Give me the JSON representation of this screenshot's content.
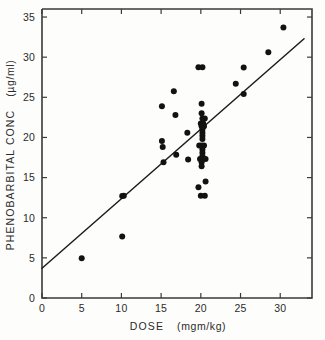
{
  "chart_data": {
    "type": "scatter",
    "title": "",
    "xlabel": "DOSE  (mgm/kg)",
    "xlabel_main": "DOSE",
    "xlabel_unit": "(mgm/kg)",
    "ylabel": "PHENOBARBITAL  CONC  (µg/ml)",
    "ylabel_main": "PHENOBARBITAL  CONC",
    "ylabel_unit": "(µg/ml)",
    "xlim": [
      0,
      34
    ],
    "ylim": [
      0,
      36
    ],
    "xticks": [
      0,
      5,
      10,
      15,
      20,
      25,
      30
    ],
    "yticks": [
      0,
      5,
      10,
      15,
      20,
      25,
      30,
      35
    ],
    "xtick_labels": [
      "0",
      "5",
      "10",
      "15",
      "20",
      "25",
      "30"
    ],
    "ytick_labels": [
      "0",
      "5",
      "10",
      "15",
      "20",
      "25",
      "30",
      "35"
    ],
    "grid": false,
    "legend": null,
    "marker": "filled-circle",
    "marker_color": "#121210",
    "point_radius_px": 3.0,
    "fit_line": {
      "label": "linear regression",
      "color": "#1d1d1b",
      "x": [
        0.0,
        33.0
      ],
      "y": [
        3.7,
        32.3
      ],
      "intercept": 3.7,
      "slope": 0.867
    },
    "points": [
      [
        5.0,
        4.95
      ],
      [
        10.1,
        7.65
      ],
      [
        10.1,
        12.7
      ],
      [
        10.3,
        12.75
      ],
      [
        15.1,
        23.9
      ],
      [
        15.1,
        19.55
      ],
      [
        15.2,
        18.8
      ],
      [
        15.3,
        16.9
      ],
      [
        16.6,
        25.75
      ],
      [
        16.8,
        22.8
      ],
      [
        16.9,
        17.85
      ],
      [
        18.3,
        20.6
      ],
      [
        18.4,
        17.25
      ],
      [
        19.7,
        28.75
      ],
      [
        20.2,
        28.75
      ],
      [
        20.1,
        24.2
      ],
      [
        20.1,
        23.0
      ],
      [
        20.2,
        22.35
      ],
      [
        20.5,
        22.35
      ],
      [
        20.0,
        21.75
      ],
      [
        20.3,
        21.75
      ],
      [
        20.1,
        21.4
      ],
      [
        20.4,
        21.4
      ],
      [
        20.2,
        21.0
      ],
      [
        20.2,
        20.6
      ],
      [
        20.2,
        20.2
      ],
      [
        20.2,
        19.8
      ],
      [
        19.8,
        19.0
      ],
      [
        20.1,
        19.0
      ],
      [
        20.4,
        19.0
      ],
      [
        20.2,
        18.5
      ],
      [
        20.2,
        18.1
      ],
      [
        20.2,
        17.7
      ],
      [
        19.9,
        17.3
      ],
      [
        20.3,
        17.3
      ],
      [
        20.6,
        17.3
      ],
      [
        20.1,
        16.9
      ],
      [
        20.1,
        16.4
      ],
      [
        20.6,
        14.5
      ],
      [
        19.7,
        13.8
      ],
      [
        20.0,
        12.75
      ],
      [
        20.5,
        12.75
      ],
      [
        24.4,
        26.7
      ],
      [
        25.4,
        28.7
      ],
      [
        25.4,
        25.4
      ],
      [
        28.5,
        30.6
      ],
      [
        30.4,
        33.7
      ]
    ]
  },
  "axes": {
    "x_axis_name": "dose-axis",
    "y_axis_name": "concentration-axis"
  }
}
